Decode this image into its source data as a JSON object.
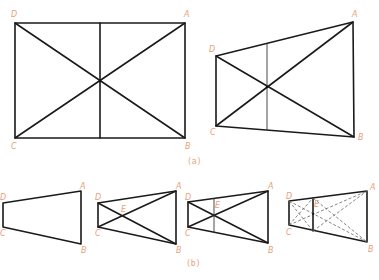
{
  "figure": {
    "panels": [
      {
        "id": "a",
        "caption": "(a)",
        "shapes": [
          {
            "name": "rectangle",
            "vertices": {
              "A": [
                185,
                23
              ],
              "B": [
                185,
                138
              ],
              "C": [
                15,
                138
              ],
              "D": [
                15,
                23
              ]
            },
            "labels": {
              "A": "A",
              "B": "B",
              "C": "C",
              "D": "D"
            },
            "diagonals": true,
            "vertical_midline": {
              "x": 100,
              "y1": 23,
              "y2": 138
            }
          },
          {
            "name": "perspective-trapezoid",
            "vertices": {
              "A": [
                353,
                22
              ],
              "B": [
                354,
                137
              ],
              "C": [
                216,
                126
              ],
              "D": [
                216,
                56
              ]
            },
            "labels": {
              "A": "A",
              "B": "B",
              "C": "C",
              "D": "D"
            },
            "diagonals": true,
            "vertical_midline": {
              "x": 267,
              "y1": 43,
              "y2": 130
            }
          }
        ]
      },
      {
        "id": "b",
        "caption": "(b)",
        "shapes": [
          {
            "name": "step-1-trapezoid",
            "labels": {
              "A": "A",
              "B": "B",
              "C": "C",
              "D": "D"
            }
          },
          {
            "name": "step-2-diagonals",
            "labels": {
              "A": "A",
              "B": "B",
              "C": "C",
              "D": "D",
              "E": "E"
            }
          },
          {
            "name": "step-3-midline",
            "labels": {
              "A": "A",
              "B": "B",
              "C": "C",
              "D": "D",
              "E": "E"
            }
          },
          {
            "name": "step-4-subdivision",
            "labels": {
              "A": "A",
              "B": "B",
              "C": "C",
              "D": "D",
              "E": "E"
            }
          }
        ]
      }
    ],
    "colors": {
      "line": "#1a1a1a",
      "label": "#e8a07a",
      "dashed": "#666666"
    }
  }
}
